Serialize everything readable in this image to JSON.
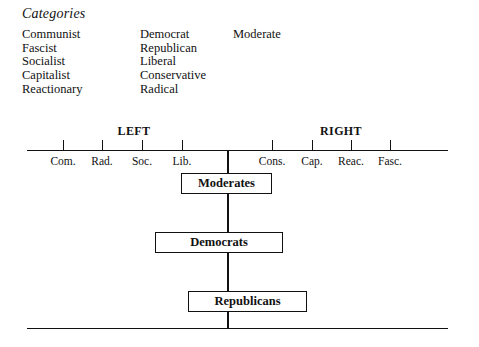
{
  "figure": {
    "heading": "Categories"
  },
  "categories": {
    "columns": [
      {
        "items": [
          "Communist",
          "Fascist",
          "Socialist",
          "Capitalist",
          "Reactionary"
        ]
      },
      {
        "items": [
          "Democrat",
          "Republican",
          "Liberal",
          "Conservative",
          "Radical"
        ]
      },
      {
        "items": [
          "Moderate"
        ]
      }
    ]
  },
  "chart_data": {
    "type": "diagram",
    "title": "Categories",
    "subtype": "political-spectrum-axis",
    "xlabel": "",
    "ylabel": "",
    "grid": false,
    "legend": null,
    "axis": {
      "left_pole_label": "LEFT",
      "right_pole_label": "RIGHT",
      "tick_labels": [
        "Com.",
        "Rad.",
        "Soc.",
        "Lib.",
        "Cons.",
        "Cap.",
        "Reac.",
        "Fasc."
      ],
      "tick_full_names": [
        "Communist",
        "Radical",
        "Socialist",
        "Liberal",
        "Conservative",
        "Capitalist",
        "Reactionary",
        "Fascist"
      ],
      "tick_positions_px": [
        63,
        102,
        142,
        182,
        272,
        312,
        351,
        390
      ],
      "center_px": 227,
      "start_px": 27,
      "end_px": 448
    },
    "groups": [
      {
        "label": "Moderates",
        "order": 1,
        "span_px": [
          181,
          272
        ],
        "width_px": 91
      },
      {
        "label": "Democrats",
        "order": 2,
        "span_px": [
          155,
          283
        ],
        "width_px": 128
      },
      {
        "label": "Republicans",
        "order": 3,
        "span_px": [
          188,
          307
        ],
        "width_px": 119
      }
    ],
    "colors": {
      "ink": "#111111",
      "background": "#ffffff"
    }
  }
}
